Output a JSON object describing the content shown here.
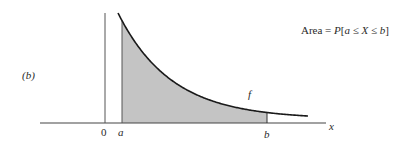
{
  "panel_label": "(b)",
  "annotation": {
    "prefix": "Area = ",
    "p": "P",
    "open": "[",
    "a": "a",
    "le1": " ≤ ",
    "X": "X",
    "le2": " ≤ ",
    "b": "b",
    "close": "]"
  },
  "axis": {
    "x_label": "x",
    "origin_label": "0",
    "a_label": "a",
    "b_label": "b"
  },
  "curve_label": "f",
  "colors": {
    "shade": "#c4c4c4",
    "line": "#1a1a1a",
    "axis": "#444444"
  }
}
